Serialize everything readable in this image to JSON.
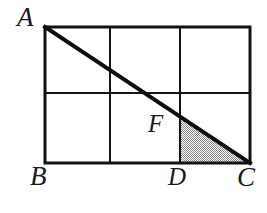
{
  "figure": {
    "kind": "geometry-diagram",
    "background_color": "#ffffff",
    "stroke_color": "#111111",
    "shade_color": "#c0c0c0",
    "outer_stroke_width": 3,
    "inner_stroke_width": 2,
    "diagonal_stroke_width": 4,
    "rectangle": {
      "left": 45,
      "top": 27,
      "right": 250,
      "bottom": 163,
      "width": 205,
      "height": 136,
      "columns": 3,
      "rows": 2
    },
    "grid": {
      "vertical_lines_x": [
        110,
        180
      ],
      "horizontal_lines_y": [
        93
      ]
    },
    "diagonal": {
      "name": "AC",
      "from": [
        45,
        27
      ],
      "to": [
        250,
        163
      ]
    },
    "shaded_triangle": {
      "name": "FDC",
      "points": [
        [
          180,
          118
        ],
        [
          180,
          163
        ],
        [
          250,
          163
        ]
      ],
      "fill": "#c0c0c0",
      "pattern": "stipple"
    },
    "labels": [
      {
        "id": "A",
        "text": "A",
        "role": "vertex",
        "anchor": "top-left-outside",
        "x": 17,
        "y": 4
      },
      {
        "id": "B",
        "text": "B",
        "role": "vertex",
        "anchor": "bottom-left-outside",
        "x": 30,
        "y": 163
      },
      {
        "id": "C",
        "text": "C",
        "role": "vertex",
        "anchor": "bottom-right-outside",
        "x": 237,
        "y": 164
      },
      {
        "id": "D",
        "text": "D",
        "role": "point",
        "anchor": "bottom-edge-outside",
        "x": 168,
        "y": 164
      },
      {
        "id": "F",
        "text": "F",
        "role": "point",
        "anchor": "interior",
        "x": 148,
        "y": 111
      }
    ]
  }
}
